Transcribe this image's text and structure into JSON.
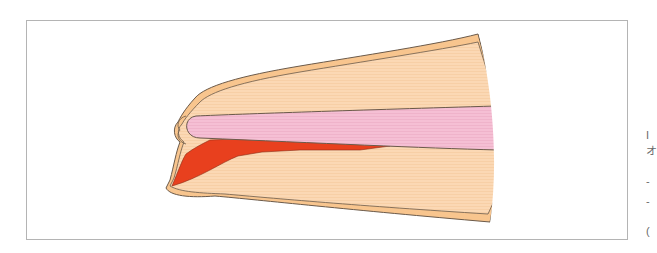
{
  "figure": {
    "frame_color": "#b4b4b4",
    "colors": {
      "skin_outer": "#f8c58e",
      "soft_tissue": "#fbd8b4",
      "nail_plate": "#f5bfd4",
      "hematoma": "#e8401e",
      "outline": "#6b5a4a"
    },
    "parts": [
      {
        "id": "dorsal-skin",
        "label": ""
      },
      {
        "id": "nail-plate",
        "label": ""
      },
      {
        "id": "subungual-hematoma",
        "label": ""
      },
      {
        "id": "pulp",
        "label": ""
      },
      {
        "id": "volar-skin",
        "label": ""
      }
    ]
  },
  "edge_text": {
    "fragments": [
      "I",
      "オ",
      "-",
      "-",
      "("
    ]
  }
}
